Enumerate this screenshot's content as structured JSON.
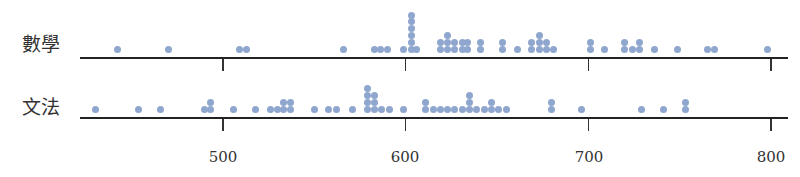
{
  "chart_data": {
    "type": "scatter",
    "subtype": "dot-plot",
    "title": "",
    "xlabel": "",
    "ylabel": "",
    "xlim": [
      420,
      805
    ],
    "x_ticks": [
      500,
      600,
      700,
      800
    ],
    "grid": false,
    "dot_color": "#8fa6cf",
    "series": [
      {
        "name": "數學",
        "points": [
          {
            "x": 442,
            "count": 1
          },
          {
            "x": 470,
            "count": 1
          },
          {
            "x": 509,
            "count": 1
          },
          {
            "x": 513,
            "count": 1
          },
          {
            "x": 566,
            "count": 1
          },
          {
            "x": 583,
            "count": 1
          },
          {
            "x": 586,
            "count": 1
          },
          {
            "x": 590,
            "count": 1
          },
          {
            "x": 599,
            "count": 1
          },
          {
            "x": 603,
            "count": 6
          },
          {
            "x": 606,
            "count": 1
          },
          {
            "x": 619,
            "count": 2
          },
          {
            "x": 623,
            "count": 3
          },
          {
            "x": 627,
            "count": 2
          },
          {
            "x": 631,
            "count": 2
          },
          {
            "x": 634,
            "count": 2
          },
          {
            "x": 641,
            "count": 2
          },
          {
            "x": 653,
            "count": 2
          },
          {
            "x": 661,
            "count": 1
          },
          {
            "x": 669,
            "count": 2
          },
          {
            "x": 673,
            "count": 3
          },
          {
            "x": 677,
            "count": 2
          },
          {
            "x": 681,
            "count": 1
          },
          {
            "x": 701,
            "count": 2
          },
          {
            "x": 709,
            "count": 1
          },
          {
            "x": 720,
            "count": 2
          },
          {
            "x": 724,
            "count": 1
          },
          {
            "x": 728,
            "count": 2
          },
          {
            "x": 736,
            "count": 1
          },
          {
            "x": 749,
            "count": 1
          },
          {
            "x": 765,
            "count": 1
          },
          {
            "x": 769,
            "count": 1
          },
          {
            "x": 798,
            "count": 1
          }
        ]
      },
      {
        "name": "文法",
        "points": [
          {
            "x": 430,
            "count": 1
          },
          {
            "x": 454,
            "count": 1
          },
          {
            "x": 466,
            "count": 1
          },
          {
            "x": 490,
            "count": 1
          },
          {
            "x": 493,
            "count": 2
          },
          {
            "x": 506,
            "count": 1
          },
          {
            "x": 518,
            "count": 1
          },
          {
            "x": 526,
            "count": 1
          },
          {
            "x": 530,
            "count": 1
          },
          {
            "x": 533,
            "count": 2
          },
          {
            "x": 537,
            "count": 2
          },
          {
            "x": 550,
            "count": 1
          },
          {
            "x": 558,
            "count": 1
          },
          {
            "x": 562,
            "count": 1
          },
          {
            "x": 571,
            "count": 1
          },
          {
            "x": 579,
            "count": 4
          },
          {
            "x": 583,
            "count": 3
          },
          {
            "x": 587,
            "count": 1
          },
          {
            "x": 591,
            "count": 1
          },
          {
            "x": 599,
            "count": 1
          },
          {
            "x": 611,
            "count": 2
          },
          {
            "x": 615,
            "count": 1
          },
          {
            "x": 619,
            "count": 1
          },
          {
            "x": 623,
            "count": 1
          },
          {
            "x": 627,
            "count": 1
          },
          {
            "x": 631,
            "count": 1
          },
          {
            "x": 635,
            "count": 3
          },
          {
            "x": 639,
            "count": 1
          },
          {
            "x": 643,
            "count": 1
          },
          {
            "x": 647,
            "count": 2
          },
          {
            "x": 651,
            "count": 1
          },
          {
            "x": 655,
            "count": 1
          },
          {
            "x": 680,
            "count": 2
          },
          {
            "x": 696,
            "count": 1
          },
          {
            "x": 729,
            "count": 1
          },
          {
            "x": 741,
            "count": 1
          },
          {
            "x": 753,
            "count": 2
          }
        ]
      }
    ]
  },
  "labels": {
    "row_math": "數學",
    "row_grammar": "文法"
  },
  "axis": {
    "tick_labels": [
      "500",
      "600",
      "700",
      "800"
    ]
  }
}
